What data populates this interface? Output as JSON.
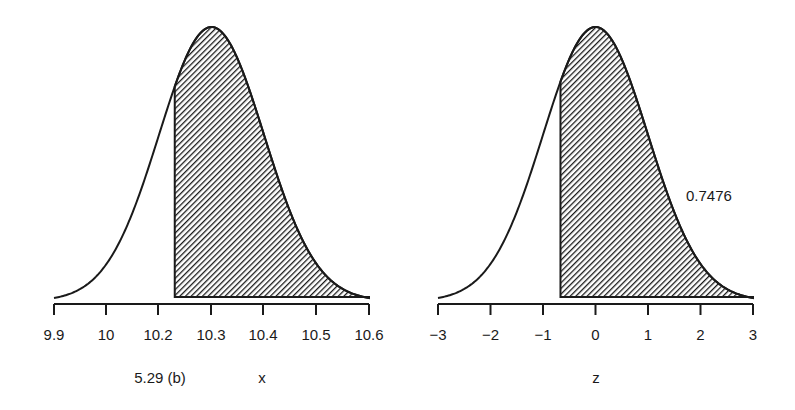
{
  "chart_data": [
    {
      "type": "area",
      "description": "Normal density curve of x with shaded area to the right of 10.23",
      "distribution": {
        "mean": 10.3,
        "sd": 0.1
      },
      "shade_from": 10.23,
      "shade_to": 10.6,
      "x_ticks": [
        9.9,
        10,
        10.2,
        10.3,
        10.4,
        10.5,
        10.6
      ],
      "x_tick_labels": [
        "9.9",
        "10",
        "10.2",
        "10.3",
        "10.4",
        "10.5",
        "10.6"
      ],
      "xlim": [
        9.9,
        10.6
      ],
      "xlabel": "x",
      "caption": "5.29  (b)",
      "grid": false
    },
    {
      "type": "area",
      "description": "Standard normal density curve of z with shaded area to the right of -0.667",
      "distribution": {
        "mean": 0,
        "sd": 1
      },
      "shade_from": -0.667,
      "shade_to": 3,
      "shaded_area": 0.7476,
      "x_ticks": [
        -3,
        -2,
        -1,
        0,
        1,
        2,
        3
      ],
      "x_tick_labels": [
        "−3",
        "−2",
        "−1",
        "0",
        "1",
        "2",
        "3"
      ],
      "xlim": [
        -3,
        3
      ],
      "xlabel": "z",
      "annotation": "0.7476",
      "grid": false
    }
  ],
  "left_panel": {
    "caption": "5.29  (b)",
    "xlabel": "x",
    "tick_labels": [
      "9.9",
      "10",
      "10.2",
      "10.3",
      "10.4",
      "10.5",
      "10.6"
    ]
  },
  "right_panel": {
    "xlabel": "z",
    "annotation": "0.7476",
    "tick_labels": [
      "−3",
      "−2",
      "−1",
      "0",
      "1",
      "2",
      "3"
    ]
  },
  "colors": {
    "ink": "#1a1a1a",
    "hatch": "#1a1a1a",
    "background": "#ffffff"
  }
}
